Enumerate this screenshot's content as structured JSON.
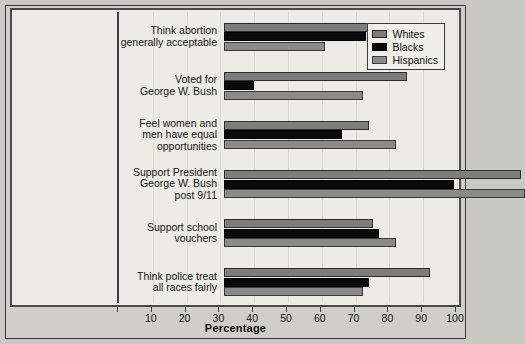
{
  "chart_data": {
    "type": "bar",
    "orientation": "horizontal",
    "title": "",
    "xlabel": "Percentage",
    "ylabel": "",
    "xlim": [
      0,
      100
    ],
    "xticks": [
      0,
      10,
      20,
      30,
      40,
      50,
      60,
      70,
      80,
      90,
      100
    ],
    "xticklabels": [
      "",
      "10",
      "20",
      "30",
      "40",
      "50",
      "60",
      "70",
      "80",
      "90",
      "100"
    ],
    "grid": true,
    "legend_position": "top-right",
    "categories": [
      "Think abortion generally acceptable",
      "Voted for George W. Bush",
      "Feel women and men have equal opportunities",
      "Support President George W. Bush post 9/11",
      "Support school vouchers",
      "Think police treat all races fairly"
    ],
    "category_lines": [
      [
        "Think abortion",
        "generally acceptable"
      ],
      [
        "Voted for",
        "George W. Bush"
      ],
      [
        "Feel women and",
        "men have equal",
        "opportunities"
      ],
      [
        "Support President",
        "George W. Bush",
        "post 9/11"
      ],
      [
        "Support school",
        "vouchers"
      ],
      [
        "Think police treat",
        "all races fairly"
      ]
    ],
    "series": [
      {
        "name": "Whites",
        "color": "#7d7d7d",
        "values": [
          43,
          54,
          43,
          88,
          44,
          61
        ]
      },
      {
        "name": "Blacks",
        "color": "#090909",
        "values": [
          42,
          9,
          35,
          68,
          46,
          43
        ]
      },
      {
        "name": "Hispanics",
        "color": "#8a8a8a",
        "values": [
          30,
          41,
          51,
          89,
          51,
          41
        ]
      }
    ]
  },
  "legend": {
    "entries": [
      {
        "label": "Whites",
        "swatch": "whites"
      },
      {
        "label": "Blacks",
        "swatch": "blacks"
      },
      {
        "label": "Hispanics",
        "swatch": "hispanics"
      }
    ]
  },
  "axis": {
    "xlabel": "Percentage"
  }
}
